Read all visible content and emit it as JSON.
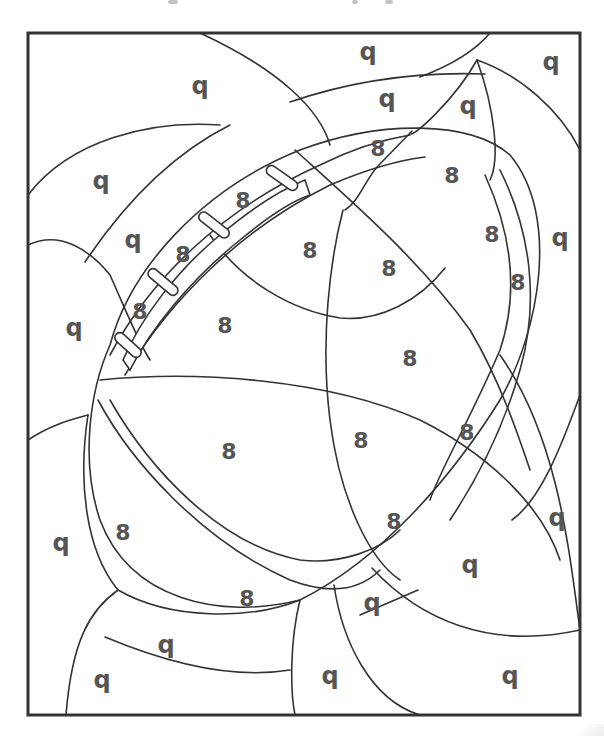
{
  "page": {
    "type": "color-by-number coloring page",
    "frame": {
      "x": 28,
      "y": 33,
      "width": 552,
      "height": 682
    }
  },
  "header": {
    "cut_off_text_fragments": [
      {
        "x": 168,
        "width": 10
      },
      {
        "x": 352,
        "width": 6
      },
      {
        "x": 385,
        "width": 8
      }
    ]
  },
  "labels": [
    {
      "text": "q",
      "x": 368,
      "y": 52,
      "kind": "q"
    },
    {
      "text": "q",
      "x": 200,
      "y": 86,
      "kind": "q"
    },
    {
      "text": "q",
      "x": 551,
      "y": 62,
      "kind": "q"
    },
    {
      "text": "q",
      "x": 387,
      "y": 99,
      "kind": "q"
    },
    {
      "text": "q",
      "x": 468,
      "y": 106,
      "kind": "q"
    },
    {
      "text": "8",
      "x": 378,
      "y": 149,
      "kind": "8"
    },
    {
      "text": "8",
      "x": 452,
      "y": 176,
      "kind": "8"
    },
    {
      "text": "q",
      "x": 101,
      "y": 181,
      "kind": "q"
    },
    {
      "text": "8",
      "x": 243,
      "y": 201,
      "kind": "8"
    },
    {
      "text": "q",
      "x": 133,
      "y": 240,
      "kind": "q"
    },
    {
      "text": "8",
      "x": 492,
      "y": 235,
      "kind": "8"
    },
    {
      "text": "q",
      "x": 560,
      "y": 238,
      "kind": "q"
    },
    {
      "text": "8",
      "x": 310,
      "y": 251,
      "kind": "8"
    },
    {
      "text": "8",
      "x": 183,
      "y": 255,
      "kind": "8"
    },
    {
      "text": "8",
      "x": 389,
      "y": 269,
      "kind": "8"
    },
    {
      "text": "8",
      "x": 518,
      "y": 283,
      "kind": "8"
    },
    {
      "text": "8",
      "x": 140,
      "y": 312,
      "kind": "8"
    },
    {
      "text": "8",
      "x": 225,
      "y": 326,
      "kind": "8"
    },
    {
      "text": "q",
      "x": 74,
      "y": 328,
      "kind": "q"
    },
    {
      "text": "8",
      "x": 410,
      "y": 359,
      "kind": "8"
    },
    {
      "text": "8",
      "x": 467,
      "y": 433,
      "kind": "8"
    },
    {
      "text": "8",
      "x": 361,
      "y": 441,
      "kind": "8"
    },
    {
      "text": "8",
      "x": 229,
      "y": 452,
      "kind": "8"
    },
    {
      "text": "8",
      "x": 123,
      "y": 533,
      "kind": "8"
    },
    {
      "text": "q",
      "x": 61,
      "y": 543,
      "kind": "q"
    },
    {
      "text": "8",
      "x": 394,
      "y": 522,
      "kind": "8"
    },
    {
      "text": "q",
      "x": 557,
      "y": 518,
      "kind": "q"
    },
    {
      "text": "q",
      "x": 470,
      "y": 565,
      "kind": "q"
    },
    {
      "text": "8",
      "x": 247,
      "y": 599,
      "kind": "8"
    },
    {
      "text": "q",
      "x": 372,
      "y": 603,
      "kind": "q"
    },
    {
      "text": "q",
      "x": 166,
      "y": 645,
      "kind": "q"
    },
    {
      "text": "q",
      "x": 102,
      "y": 680,
      "kind": "q"
    },
    {
      "text": "q",
      "x": 330,
      "y": 676,
      "kind": "q"
    },
    {
      "text": "q",
      "x": 510,
      "y": 676,
      "kind": "q"
    }
  ],
  "colors": {
    "line": "#333333",
    "label": "#555555",
    "background": "#ffffff"
  }
}
